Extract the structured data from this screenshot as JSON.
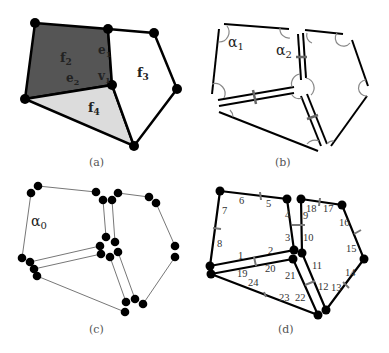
{
  "panels": {
    "a": {
      "caption": "(a)",
      "labels": {
        "f2": "f",
        "f2_sub": "2",
        "f3": "f",
        "f3_sub": "3",
        "f4": "f",
        "f4_sub": "4",
        "e1": "e",
        "e1_sub": "1",
        "e2": "e",
        "e2_sub": "2",
        "v1": "v",
        "v1_sub": "1"
      },
      "colors": {
        "f2_fill": "#555555",
        "f4_fill": "#dcdcdc",
        "f3_fill": "#ffffff",
        "edge": "#000000"
      }
    },
    "b": {
      "caption": "(b)",
      "labels": {
        "alpha1": "α",
        "alpha1_sub": "1",
        "alpha2": "α",
        "alpha2_sub": "2"
      }
    },
    "c": {
      "caption": "(c)",
      "labels": {
        "alpha0": "α",
        "alpha0_sub": "0"
      }
    },
    "d": {
      "caption": "(d)",
      "dart_numbers": [
        "1",
        "2",
        "3",
        "4",
        "5",
        "6",
        "7",
        "8",
        "9",
        "10",
        "11",
        "12",
        "13",
        "14",
        "15",
        "16",
        "17",
        "18",
        "19",
        "20",
        "21",
        "22",
        "23",
        "24"
      ]
    }
  }
}
